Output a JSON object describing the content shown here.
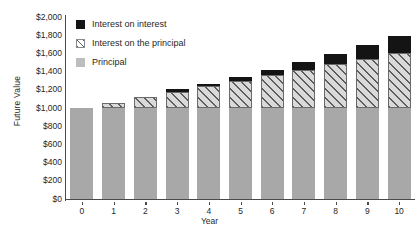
{
  "chart_data": {
    "type": "bar",
    "subtype": "stacked",
    "title": "",
    "xlabel": "Year",
    "ylabel": "Future Value",
    "categories": [
      "0",
      "1",
      "2",
      "3",
      "4",
      "5",
      "6",
      "7",
      "8",
      "9",
      "10"
    ],
    "x": [
      0,
      1,
      2,
      3,
      4,
      5,
      6,
      7,
      8,
      9,
      10
    ],
    "ylim": [
      0,
      2000
    ],
    "ytick_labels": [
      "$0",
      "$200",
      "$400",
      "$600",
      "$800",
      "$1,000",
      "$1,200",
      "$1,400",
      "$1,600",
      "$1,800",
      "$2,000"
    ],
    "ytick_values": [
      0,
      200,
      400,
      600,
      800,
      1000,
      1200,
      1400,
      1600,
      1800,
      2000
    ],
    "grid": false,
    "legend_position": "upper-left-inside",
    "series": [
      {
        "name": "Principal",
        "color": "#a8a8a8",
        "fill": "solid",
        "values": [
          1000,
          1000,
          1000,
          1000,
          1000,
          1000,
          1000,
          1000,
          1000,
          1000,
          1000
        ]
      },
      {
        "name": "Interest on the principal",
        "color": "#d9d9d9",
        "fill": "diagonal-hatch",
        "values": [
          0,
          60,
          120,
          180,
          240,
          300,
          360,
          420,
          480,
          540,
          600
        ]
      },
      {
        "name": "Interest on interest",
        "color": "#141414",
        "fill": "solid",
        "values": [
          0,
          0,
          3.6,
          11.1,
          22.5,
          38.2,
          58.5,
          83.8,
          114.4,
          150.9,
          193.9
        ]
      }
    ],
    "totals": [
      1000,
      1060,
      1123.6,
      1191.0,
      1262.5,
      1338.2,
      1418.5,
      1503.6,
      1593.8,
      1689.5,
      1790.8
    ],
    "annotations": []
  },
  "legend": {
    "items": [
      {
        "label": "Interest on interest",
        "swatch": "black-square-icon"
      },
      {
        "label": "Interest on the principal",
        "swatch": "hatched-square-icon"
      },
      {
        "label": "Principal",
        "swatch": "gray-square-icon"
      }
    ]
  },
  "axes": {
    "y_title": "Future Value",
    "x_title": "Year"
  }
}
